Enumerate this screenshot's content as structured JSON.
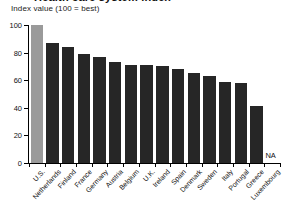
{
  "chart": {
    "title": "Health care system index",
    "subtitle": "Index value (100 = best)",
    "na_label": "NA"
  },
  "chart_data": {
    "type": "bar",
    "title": "Health care system index",
    "subtitle": "Index value (100 = best)",
    "xlabel": "",
    "ylabel": "Index value (100 = best)",
    "ylim": [
      0,
      100
    ],
    "yticks": [
      0,
      20,
      40,
      60,
      80,
      100
    ],
    "grid": false,
    "legend": null,
    "highlight_category": "U.S.",
    "highlight_color": "#9a9a9a",
    "bar_color": "#262626",
    "categories": [
      "U.S.",
      "Netherlands",
      "Finland",
      "France",
      "Germany",
      "Austria",
      "Belgium",
      "U.K.",
      "Ireland",
      "Spain",
      "Denmark",
      "Sweden",
      "Italy",
      "Portugal",
      "Greece",
      "Luxembourg"
    ],
    "values": [
      100,
      87,
      84,
      79,
      77,
      73,
      71,
      71,
      70,
      68,
      65,
      63,
      59,
      58,
      41,
      null
    ],
    "missing": [
      "Luxembourg"
    ],
    "missing_marker": "NA"
  }
}
